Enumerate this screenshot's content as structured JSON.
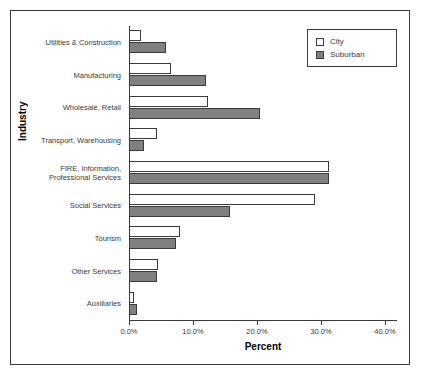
{
  "chart_data": {
    "type": "bar",
    "orientation": "horizontal",
    "title": "",
    "xlabel": "Percent",
    "ylabel": "Industry",
    "xlim": [
      0,
      40
    ],
    "xticks": [
      "0.0%",
      "10.0%",
      "20.0%",
      "30.0%",
      "40.0%"
    ],
    "xtick_values": [
      0,
      10,
      20,
      30,
      40
    ],
    "grid": false,
    "legend_position": "top-right",
    "categories": [
      "Utilities & Construction",
      "Manufacturing",
      "Wholesale, Retail",
      "Transport, Warehousing",
      "FIRE, Information,\nProfessional Services",
      "Social Services",
      "Tourism",
      "Other Services",
      "Auxiliaries"
    ],
    "series": [
      {
        "name": "City",
        "color": "#ffffff",
        "values": [
          1.8,
          6.6,
          12.3,
          4.4,
          31.2,
          29.0,
          8.0,
          4.6,
          0.8
        ]
      },
      {
        "name": "Suburban",
        "color": "#808080",
        "values": [
          5.8,
          12.0,
          20.5,
          2.3,
          31.3,
          15.8,
          7.3,
          4.3,
          1.2
        ]
      }
    ]
  },
  "legend": {
    "items": [
      {
        "label": "City"
      },
      {
        "label": "Suburban"
      }
    ]
  },
  "axes": {
    "x_title": "Percent",
    "y_title": "Industry"
  },
  "colors": {
    "city_fill": "#ffffff",
    "suburban_fill": "#808080",
    "line": "#3a3a3a"
  }
}
